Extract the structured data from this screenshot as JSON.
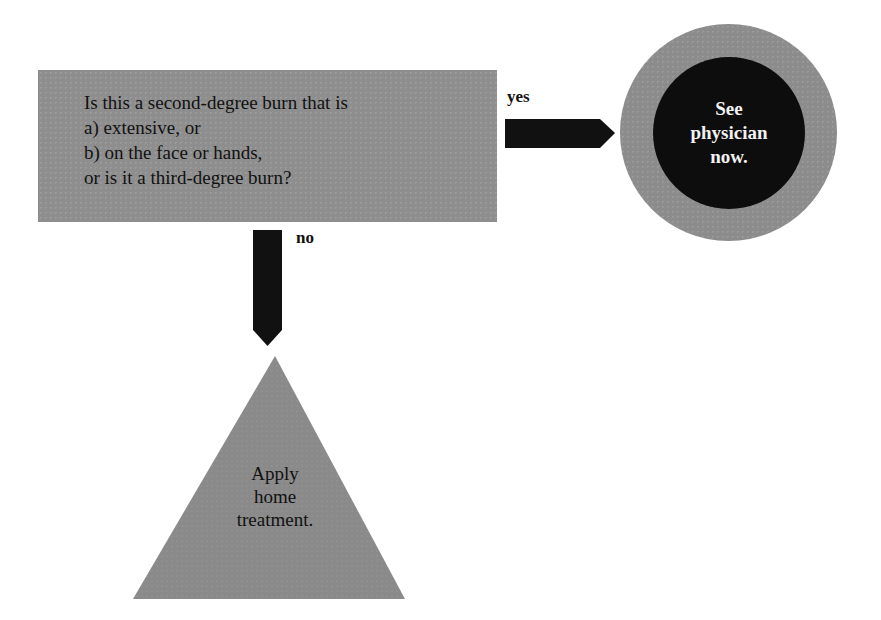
{
  "diagram": {
    "type": "flowchart",
    "question": {
      "lines": [
        "Is this a second-degree burn that is",
        "a)  extensive, or",
        "b)  on the face or hands,",
        "or is it a third-degree burn?"
      ]
    },
    "yes_branch": {
      "label": "yes",
      "outcome_lines": [
        "See",
        "physician",
        "now."
      ]
    },
    "no_branch": {
      "label": "no",
      "outcome_lines": [
        "Apply",
        "home",
        "treatment."
      ]
    },
    "colors": {
      "box_gray": "#8e8e8e",
      "circle_outer_gray": "#8c8c8c",
      "circle_inner": "#0d0d0d",
      "arrow": "#111111",
      "triangle_gray": "#8a8a8a",
      "background": "#ffffff"
    }
  }
}
